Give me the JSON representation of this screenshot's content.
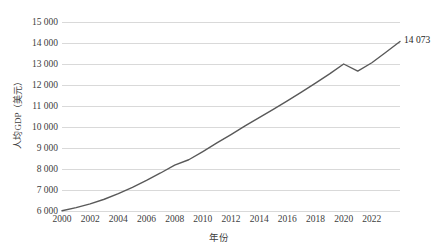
{
  "chart_data": {
    "type": "line",
    "title": "",
    "xlabel": "年份",
    "ylabel": "人均GDP（美元）",
    "xlim": [
      2000,
      2024
    ],
    "ylim": [
      6000,
      15000
    ],
    "ytick_step": 1000,
    "xtick_step": 2,
    "grid": "horizontal",
    "legend": "none",
    "line_color": "#595959",
    "grid_color": "#d9d9d9",
    "ytick_labels": [
      "15 000",
      "14 000",
      "13 000",
      "12 000",
      "11 000",
      "10 000",
      "9 000",
      "8 000",
      "7 000",
      "6 000"
    ],
    "ytick_values": [
      15000,
      14000,
      13000,
      12000,
      11000,
      10000,
      9000,
      8000,
      7000,
      6000
    ],
    "xtick_labels": [
      "2000",
      "2002",
      "2004",
      "2006",
      "2008",
      "2010",
      "2012",
      "2014",
      "2016",
      "2018",
      "2020",
      "2022"
    ],
    "xtick_values": [
      2000,
      2002,
      2004,
      2006,
      2008,
      2010,
      2012,
      2014,
      2016,
      2018,
      2020,
      2022
    ],
    "x": [
      2000,
      2001,
      2002,
      2003,
      2004,
      2005,
      2006,
      2007,
      2008,
      2009,
      2010,
      2011,
      2012,
      2013,
      2014,
      2015,
      2016,
      2017,
      2018,
      2019,
      2020,
      2021,
      2022,
      2023,
      2024
    ],
    "values": [
      6010,
      6160,
      6340,
      6560,
      6830,
      7130,
      7460,
      7810,
      8180,
      8440,
      8830,
      9240,
      9640,
      10050,
      10450,
      10840,
      11240,
      11660,
      12090,
      12530,
      13000,
      12660,
      13060,
      13560,
      14073
    ],
    "annotations": [
      {
        "text": "14 073",
        "x": 2024,
        "y": 14073
      }
    ]
  }
}
